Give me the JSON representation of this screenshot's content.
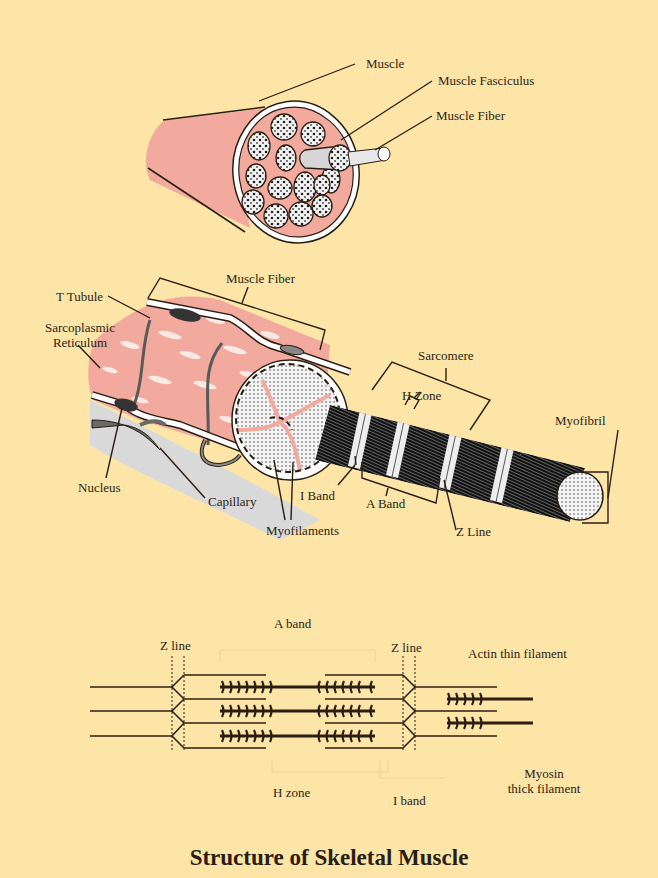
{
  "title": "Structure of Skeletal Muscle",
  "colors": {
    "background": "#fde5a8",
    "muscle_pink": "#f2aa9e",
    "sheath_white": "#ffffff",
    "membrane_gray": "#5a5a5a",
    "filament_black": "#1a1a1a",
    "outline": "#2a1e12",
    "connective_gray": "#d9d9d9"
  },
  "panel_1_muscle": {
    "labels": {
      "muscle": "Muscle",
      "muscle_fasciculus": "Muscle Fasciculus",
      "muscle_fiber": "Muscle Fiber"
    }
  },
  "panel_2_fiber": {
    "labels": {
      "muscle_fiber": "Muscle Fiber",
      "t_tubule": "T Tubule",
      "sarcoplasmic_reticulum_line1": "Sarcoplasmic",
      "sarcoplasmic_reticulum_line2": "Reticulum",
      "sarcomere": "Sarcomere",
      "h_zone": "H Zone",
      "myofibril": "Myofibril",
      "nucleus": "Nucleus",
      "capillary": "Capillary",
      "i_band": "I Band",
      "a_band": "A Band",
      "myofilaments": "Myofilaments",
      "z_line": "Z Line"
    }
  },
  "panel_3_sarcomere": {
    "labels": {
      "a_band": "A band",
      "z_line_left": "Z line",
      "z_line_right": "Z line",
      "actin_thin_filament": "Actin thin filament",
      "myosin_line1": "Myosin",
      "myosin_line2": "thick filament",
      "h_zone": "H zone",
      "i_band": "I band"
    }
  }
}
